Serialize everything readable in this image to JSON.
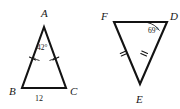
{
  "figure": {
    "background_color": "#ffffff",
    "stroke_color": "#131313",
    "width": 180,
    "height": 109,
    "triangles": [
      {
        "id": "triangle-abc",
        "name": "left-triangle-ABC",
        "vertices": [
          {
            "label": "A",
            "x": 44,
            "y": 27,
            "label_x": 41,
            "label_y": 17
          },
          {
            "label": "B",
            "x": 22,
            "y": 88,
            "label_x": 9,
            "label_y": 95
          },
          {
            "label": "C",
            "x": 66,
            "y": 88,
            "label_x": 70,
            "label_y": 95
          }
        ],
        "angle_marks": [
          {
            "at": "A",
            "value": "42°",
            "label_x": 37,
            "label_y": 50
          }
        ],
        "side_labels": [
          {
            "side": "BC",
            "value": "12",
            "label_x": 39,
            "label_y": 101
          }
        ],
        "congruence_ticks": [
          {
            "side": "AB",
            "count": 1
          },
          {
            "side": "AC",
            "count": 1
          }
        ]
      },
      {
        "id": "triangle-fde",
        "name": "right-triangle-FDE",
        "vertices": [
          {
            "label": "F",
            "x": 114,
            "y": 22,
            "label_x": 101,
            "label_y": 20
          },
          {
            "label": "D",
            "x": 167,
            "y": 22,
            "label_x": 170,
            "label_y": 20
          },
          {
            "label": "E",
            "x": 140,
            "y": 84,
            "label_x": 136,
            "label_y": 103
          }
        ],
        "angle_marks": [
          {
            "at": "D",
            "value": "69°",
            "label_x": 148,
            "label_y": 33
          }
        ],
        "side_labels": [],
        "congruence_ticks": [
          {
            "side": "FE",
            "count": 2
          },
          {
            "side": "DE",
            "count": 2
          }
        ]
      }
    ]
  }
}
